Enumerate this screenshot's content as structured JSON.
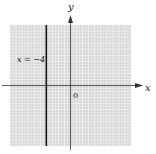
{
  "chart_data": {
    "type": "line",
    "title": "",
    "xlabel": "x",
    "ylabel": "y",
    "origin_label": "0",
    "xlim": [
      -10,
      10
    ],
    "ylim": [
      -10,
      10
    ],
    "grid": true,
    "series": [
      {
        "name": "x = −4",
        "kind": "vertical-line",
        "x": [
          -4,
          -4
        ],
        "y": [
          -10,
          10
        ]
      }
    ],
    "annotations": [
      {
        "text": "x = −4",
        "x": -8.5,
        "y": 4.5
      }
    ]
  },
  "colors": {
    "grid_bg": "#d6d6d6",
    "grid_line": "#f2f2f2",
    "axis": "#333333",
    "series": "#1a1a1a"
  }
}
